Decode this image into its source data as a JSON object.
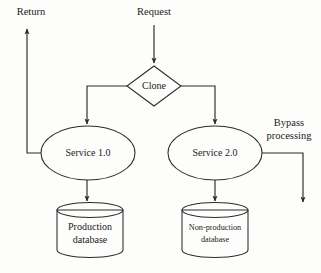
{
  "diagram": {
    "colors": {
      "background": "#fdfdfc",
      "stroke": "#2b2b2b",
      "text": "#1a1a1a",
      "shape_fill_plain": "#ffffff",
      "shape_fill_shaded": "#c9c9c9",
      "cylinder_top_shaded": "#d6d6d6"
    },
    "nodes": {
      "request": {
        "label": "Request",
        "type": "input-label"
      },
      "return": {
        "label": "Return",
        "type": "output-label"
      },
      "clone": {
        "label": "Clone",
        "type": "decision-diamond",
        "fill": "#ffffff"
      },
      "service_one": {
        "label": "Service 1.0",
        "type": "ellipse",
        "fill": "#ffffff"
      },
      "service_two": {
        "label": "Service 2.0",
        "type": "ellipse",
        "fill": "#c9c9c9"
      },
      "production_db": {
        "label_line1": "Production",
        "label_line2": "database",
        "type": "cylinder",
        "fill": "#ffffff"
      },
      "nonproduction_db": {
        "label_line1": "Non-production",
        "label_line2": "database",
        "type": "cylinder",
        "fill": "#c9c9c9"
      },
      "bypass": {
        "label_line1": "Bypass",
        "label_line2": "processing",
        "type": "edge-label"
      }
    },
    "edges": [
      {
        "name": "request-to-clone",
        "from": "Request",
        "to": "Clone",
        "arrow": true
      },
      {
        "name": "clone-to-service-one",
        "from": "Clone",
        "to": "Service 1.0",
        "arrow": true
      },
      {
        "name": "clone-to-service-two",
        "from": "Clone",
        "to": "Service 2.0",
        "arrow": true
      },
      {
        "name": "service-one-to-production-db",
        "from": "Service 1.0",
        "to": "Production database",
        "arrow": true
      },
      {
        "name": "service-two-to-nonproduction-db",
        "from": "Service 2.0",
        "to": "Non-production database",
        "arrow": true
      },
      {
        "name": "service-one-to-return",
        "from": "Service 1.0",
        "to": "Return",
        "arrow": true
      },
      {
        "name": "service-two-bypass",
        "from": "Service 2.0",
        "to": "Bypass processing",
        "arrow": true
      }
    ]
  }
}
